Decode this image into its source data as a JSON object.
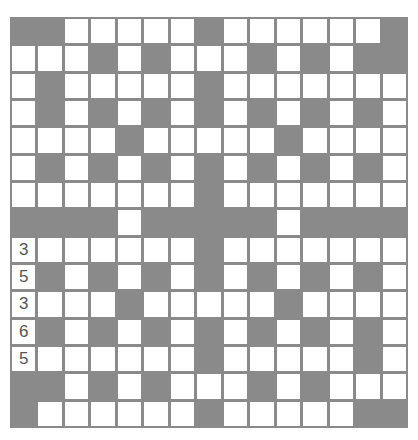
{
  "puzzle": {
    "type": "crossword",
    "size": {
      "rows": 15,
      "cols": 15
    },
    "colors": {
      "block": "#8a8a8a",
      "cell": "#ffffff",
      "gridline": "#8a8a8a",
      "number": "#555555"
    },
    "layout": [
      "BBWWWWWBWWWWWWB",
      "WWWBWBWWWBWBWBB",
      "WBWWWWWBWWWWWWW",
      "WBWBWBWBWBWBWBW",
      "WWWWBWWWWWBWWWW",
      "WBWBWBWBWBWBWBW",
      "WWWWWWWBWWWWWWW",
      "BBBBWBBBBBWBBBB",
      "WWWWWWWBWWWWWWW",
      "WBWBWBWBWBWBWBW",
      "WWWWBWWWWWBWWWW",
      "WBWBWBWBWBWBWBW",
      "WWWWWWWBWWWWWBW",
      "BBWBWBWWWBWBWWW",
      "BWWWWWWBWWWWWBB"
    ],
    "cell_values": {
      "8,0": "3",
      "9,0": "5",
      "10,0": "3",
      "11,0": "6",
      "12,0": "5"
    }
  }
}
